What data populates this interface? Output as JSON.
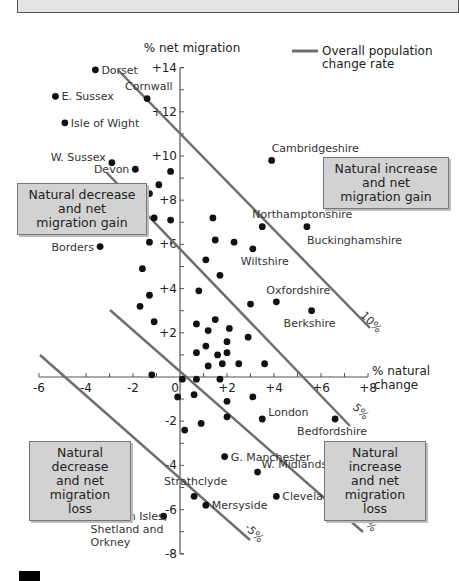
{
  "chart_data": {
    "type": "scatter",
    "title": "",
    "xlabel": "% natural change",
    "ylabel": "% net migration",
    "xlim": [
      -6,
      8
    ],
    "ylim": [
      -8,
      14
    ],
    "x_ticks": [
      "-6",
      "-4",
      "-2",
      "0",
      "+2",
      "+4",
      "+6",
      "+8"
    ],
    "y_ticks": [
      "+14",
      "+12",
      "+10",
      "+8",
      "+6",
      "+4",
      "+2",
      "-2",
      "-4",
      "-6",
      "-8"
    ],
    "grid": false,
    "legend": {
      "position": "top-right",
      "entries": [
        {
          "label": "Overall population change rate",
          "style": "gray line"
        }
      ]
    },
    "reference_lines": [
      {
        "label": "10%",
        "equation": "x + y = 10"
      },
      {
        "label": "5%",
        "equation": "x + y = 5"
      },
      {
        "label": "0%",
        "equation": "x + y = 0"
      },
      {
        "label": "-5%",
        "equation": "x + y = -5"
      }
    ],
    "quadrant_labels": [
      {
        "label": "Natural increase and net migration gain",
        "quadrant": "upper-right"
      },
      {
        "label": "Natural decrease and net migration gain",
        "quadrant": "upper-left"
      },
      {
        "label": "Natural decrease and net migration loss",
        "quadrant": "lower-left"
      },
      {
        "label": "Natural increase and net migration loss",
        "quadrant": "lower-right"
      }
    ],
    "labeled_points": [
      {
        "name": "Dorset",
        "x": -3.6,
        "y": 13.9
      },
      {
        "name": "E. Sussex",
        "x": -5.3,
        "y": 12.7
      },
      {
        "name": "Cornwall",
        "x": -1.4,
        "y": 12.6
      },
      {
        "name": "Isle of Wight",
        "x": -4.9,
        "y": 11.5
      },
      {
        "name": "W. Sussex",
        "x": -2.9,
        "y": 9.7
      },
      {
        "name": "Devon",
        "x": -1.9,
        "y": 9.4
      },
      {
        "name": "Cambridgeshire",
        "x": 3.9,
        "y": 9.8
      },
      {
        "name": "Northamptonshire",
        "x": 3.5,
        "y": 6.8
      },
      {
        "name": "Buckinghamshire",
        "x": 5.4,
        "y": 6.8
      },
      {
        "name": "Borders",
        "x": -3.4,
        "y": 5.9
      },
      {
        "name": "Wiltshire",
        "x": 3.1,
        "y": 5.8
      },
      {
        "name": "Oxfordshire",
        "x": 4.1,
        "y": 3.4
      },
      {
        "name": "Berkshire",
        "x": 5.6,
        "y": 3.0
      },
      {
        "name": "London",
        "x": 3.5,
        "y": -1.9
      },
      {
        "name": "Bedfordshire",
        "x": 6.6,
        "y": -1.9
      },
      {
        "name": "G. Manchester",
        "x": 1.9,
        "y": -3.6
      },
      {
        "name": "W. Midlands",
        "x": 3.3,
        "y": -4.3
      },
      {
        "name": "Strathclyde",
        "x": 0.6,
        "y": -5.4
      },
      {
        "name": "Cleveland",
        "x": 4.1,
        "y": -5.4
      },
      {
        "name": "Mersyside",
        "x": 1.1,
        "y": -5.8
      },
      {
        "name": "Western Isles, Shetland and Orkney",
        "x": -0.7,
        "y": -6.3
      }
    ],
    "unlabeled_points": [
      [
        -0.4,
        9.3
      ],
      [
        -0.9,
        8.7
      ],
      [
        -1.3,
        8.3
      ],
      [
        -1.1,
        7.2
      ],
      [
        -0.4,
        7.1
      ],
      [
        -1.3,
        6.1
      ],
      [
        -1.6,
        4.9
      ],
      [
        -1.3,
        3.7
      ],
      [
        -1.7,
        3.2
      ],
      [
        -1.1,
        2.5
      ],
      [
        1.4,
        7.2
      ],
      [
        1.5,
        6.2
      ],
      [
        2.3,
        6.1
      ],
      [
        1.1,
        5.3
      ],
      [
        1.7,
        4.6
      ],
      [
        0.8,
        3.9
      ],
      [
        3.0,
        3.3
      ],
      [
        0.7,
        2.4
      ],
      [
        1.2,
        2.1
      ],
      [
        1.5,
        2.6
      ],
      [
        2.1,
        2.2
      ],
      [
        2.9,
        1.8
      ],
      [
        0.7,
        1.1
      ],
      [
        1.1,
        1.4
      ],
      [
        1.6,
        1.0
      ],
      [
        2.0,
        1.1
      ],
      [
        1.2,
        0.5
      ],
      [
        2.0,
        1.6
      ],
      [
        1.8,
        0.6
      ],
      [
        2.5,
        0.6
      ],
      [
        3.6,
        0.6
      ],
      [
        -1.2,
        0.1
      ],
      [
        0.1,
        -0.1
      ],
      [
        0.7,
        -0.1
      ],
      [
        1.7,
        -0.1
      ],
      [
        -0.1,
        -0.9
      ],
      [
        0.6,
        -0.8
      ],
      [
        2.0,
        -1.1
      ],
      [
        3.1,
        -0.9
      ],
      [
        2.0,
        -1.8
      ],
      [
        0.9,
        -2.1
      ],
      [
        0.2,
        -2.4
      ]
    ]
  },
  "labels": {
    "y_axis_title": "% net migration",
    "x_axis_title_line1": "% natural",
    "x_axis_title_line2": "change",
    "legend_line1": "Overall population",
    "legend_line2": "change rate",
    "q_ur": [
      "Natural increase",
      "and net",
      "migration gain"
    ],
    "q_ul": [
      "Natural decrease",
      "and net",
      "migration gain"
    ],
    "q_ll": [
      "Natural decrease",
      "and net",
      "migration loss"
    ],
    "q_lr": [
      "Natural increase",
      "and net",
      "migration loss"
    ]
  },
  "colors": {
    "line": "#6e6e6e",
    "dot": "#111111",
    "box_bg": "#d2d2d2",
    "axis": "#555555"
  }
}
